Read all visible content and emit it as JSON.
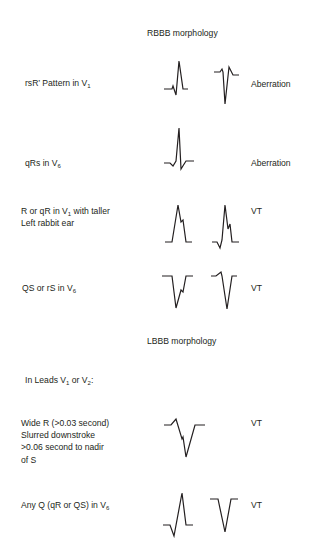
{
  "sections": [
    {
      "title": "RBBB morphology",
      "rows": [
        {
          "criterion_main": "rsR’ Pattern in V",
          "criterion_sub": "1",
          "criterion_tail": "",
          "result": "Aberration",
          "waveforms": [
            "rsR-prime-upright",
            "rS-with-notch"
          ]
        },
        {
          "criterion_main": "qRs in V",
          "criterion_sub": "6",
          "criterion_tail": "",
          "result": "Aberration",
          "waveforms": [
            "qRs"
          ]
        },
        {
          "criterion_line1_a": "R or qR in V",
          "criterion_line1_sub": "1",
          "criterion_line1_b": " with taller",
          "criterion_line2": "Left rabbit ear",
          "result": "VT",
          "waveforms": [
            "R-taller-left-ear",
            "qR-taller-left-ear"
          ]
        },
        {
          "criterion_main": "QS or rS in V",
          "criterion_sub": "6",
          "criterion_tail": "",
          "result": "VT",
          "waveforms": [
            "QS-notched",
            "rS"
          ]
        }
      ]
    },
    {
      "title": "LBBB morphology",
      "intro_a": "In Leads V",
      "intro_sub1": "1",
      "intro_b": " or V",
      "intro_sub2": "2",
      "intro_c": ":",
      "rows": [
        {
          "criterion_lines": [
            "Wide R (>0.03 second)",
            "Slurred downstroke",
            ">0.06 second to nadir",
            "of S"
          ],
          "result": "VT",
          "waveforms": [
            "wide-r-slurred-s"
          ]
        },
        {
          "criterion_main": "Any Q (qR or QS) in V",
          "criterion_sub": "6",
          "criterion_tail": "",
          "result": "VT",
          "waveforms": [
            "qR",
            "QS"
          ]
        }
      ]
    }
  ]
}
